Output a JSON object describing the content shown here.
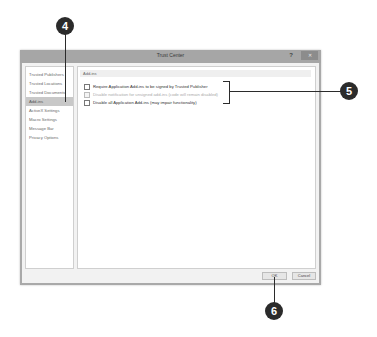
{
  "dialog": {
    "title": "Trust Center",
    "help_label": "?",
    "close_label": "✕",
    "nav": {
      "items": [
        {
          "label": "Trusted Publishers",
          "selected": false
        },
        {
          "label": "Trusted Locations",
          "selected": false
        },
        {
          "label": "Trusted Documents",
          "selected": false
        },
        {
          "label": "Add-ins",
          "selected": true
        },
        {
          "label": "ActiveX Settings",
          "selected": false
        },
        {
          "label": "Macro Settings",
          "selected": false
        },
        {
          "label": "Message Bar",
          "selected": false
        },
        {
          "label": "Privacy Options",
          "selected": false
        }
      ]
    },
    "content": {
      "section_header": "Add-ins",
      "options": [
        {
          "label": "Require Application Add-ins to be signed by Trusted Publisher",
          "checked": false,
          "enabled": true
        },
        {
          "label": "Disable notification for unsigned add-ins (code will remain disabled)",
          "checked": false,
          "enabled": false
        },
        {
          "label": "Disable all Application Add-ins (may impair functionality)",
          "checked": false,
          "enabled": true
        }
      ]
    },
    "footer": {
      "ok_label": "OK",
      "cancel_label": "Cancel"
    }
  },
  "callouts": {
    "step4": "4",
    "step5": "5",
    "step6": "6"
  },
  "colors": {
    "callout": "#2b2b2b",
    "frame": "#a9a9a9",
    "selected_nav": "#c8c8c8"
  }
}
